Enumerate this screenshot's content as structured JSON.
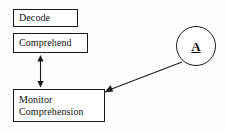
{
  "diagram": {
    "background_color": "#fefefe",
    "stroke_color": "#1a1a1a",
    "nodes": [
      {
        "id": "decode",
        "label": "Decode",
        "shape": "rectangle"
      },
      {
        "id": "comprehend",
        "label": "Comprehend",
        "shape": "rectangle"
      },
      {
        "id": "monitor",
        "label_line1": "Monitor",
        "label_line2": "Comprehension",
        "shape": "rectangle"
      },
      {
        "id": "agent",
        "label": "A",
        "shape": "circle",
        "bold": true,
        "underlined": true
      }
    ],
    "connectors": [
      {
        "id": "comprehend-monitor",
        "from": "comprehend",
        "to": "monitor",
        "style": "double-headed-vertical-arrow"
      },
      {
        "id": "agent-monitor",
        "from": "agent",
        "to": "monitor",
        "style": "single-headed-diagonal-arrow"
      }
    ]
  }
}
